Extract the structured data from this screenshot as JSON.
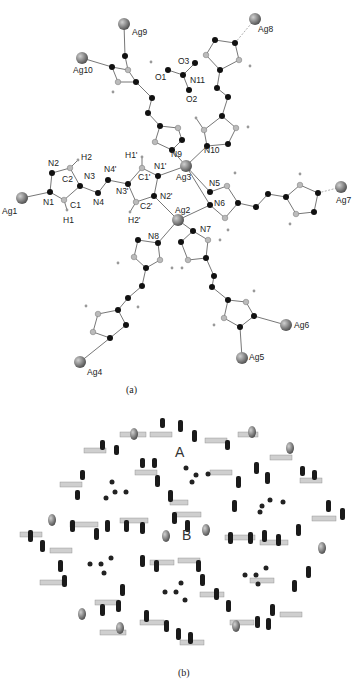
{
  "figure": {
    "panel_a": {
      "caption": "(a)",
      "description": "Coordination environment of Ag centers with bis-triazole ligands and nitrate anion",
      "atom_labels": {
        "ag": [
          "Ag1",
          "Ag2",
          "Ag3",
          "Ag4",
          "Ag5",
          "Ag6",
          "Ag7",
          "Ag8",
          "Ag9",
          "Ag10"
        ],
        "n": [
          "N1",
          "N2",
          "N3",
          "N4",
          "N1'",
          "N2'",
          "N3'",
          "N4'",
          "N5",
          "N6",
          "N7",
          "N8",
          "N9",
          "N10",
          "N11"
        ],
        "c": [
          "C1",
          "C2",
          "C1'",
          "C2'"
        ],
        "h": [
          "H1",
          "H2",
          "H1'",
          "H2'"
        ],
        "o": [
          "O1",
          "O2",
          "O3"
        ]
      }
    },
    "panel_b": {
      "caption": "(b)",
      "description": "3D framework packing view showing channels",
      "channel_labels": [
        "A",
        "B"
      ]
    }
  },
  "labels": {
    "ag1": "Ag1",
    "ag2": "Ag2",
    "ag3": "Ag3",
    "ag4": "Ag4",
    "ag5": "Ag5",
    "ag6": "Ag6",
    "ag7": "Ag7",
    "ag8": "Ag8",
    "ag9": "Ag9",
    "ag10": "Ag10",
    "n1": "N1",
    "n2": "N2",
    "n3": "N3",
    "n4": "N4",
    "n1p": "N1'",
    "n2p": "N2'",
    "n3p": "N3'",
    "n4p": "N4'",
    "n5": "N5",
    "n6": "N6",
    "n7": "N7",
    "n8": "N8",
    "n9": "N9",
    "n10": "N10",
    "n11": "N11",
    "c1": "C1",
    "c2": "C2",
    "c1p": "C1'",
    "c2p": "C2'",
    "h1": "H1",
    "h2": "H2",
    "h1p": "H1'",
    "h2p": "H2'",
    "o1": "O1",
    "o2": "O2",
    "o3": "O3",
    "cap_a": "(a)",
    "cap_b": "(b)",
    "chanA": "A",
    "chanB": "B"
  },
  "colors": {
    "silver": "#8a8a8a",
    "nitrogen": "#111111",
    "carbon": "#bdbdbd",
    "background": "#ffffff"
  }
}
